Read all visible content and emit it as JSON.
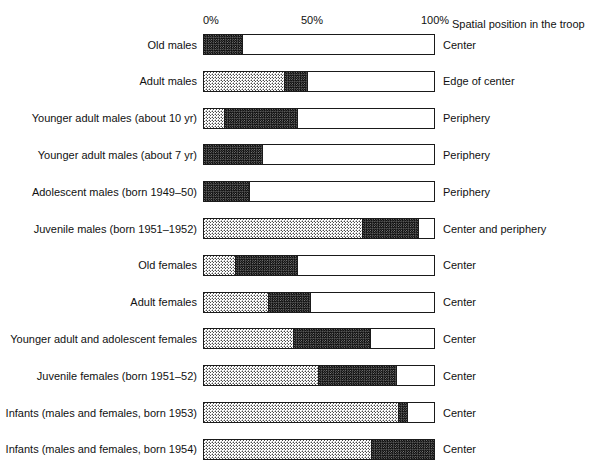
{
  "chart_data": {
    "type": "bar",
    "subtype": "stacked-horizontal-percentage",
    "title": "",
    "xlabel": "",
    "ylabel": "",
    "xlim": [
      0,
      100
    ],
    "grid": false,
    "legend_position": "none",
    "axis_caption": "Spatial position in the troop",
    "tick_labels": [
      "0%",
      "50%",
      "100%"
    ],
    "tick_values": [
      0,
      50,
      100
    ],
    "series": [
      {
        "name": "dark-stipple",
        "color": "#555555"
      },
      {
        "name": "light-stipple",
        "color": "#cccccc"
      },
      {
        "name": "white",
        "color": "#ffffff"
      }
    ],
    "categories": [
      "Old males",
      "Adult males",
      "Younger adult males (about 10 yr)",
      "Younger adult males (about 7 yr)",
      "Adolescent males (born 1949–50)",
      "Juvenile males (born 1951–1952)",
      "Old females",
      "Adult females",
      "Younger adult and adolescent females",
      "Juvenile females (born 1951–52)",
      "Infants (males and females, born 1953)",
      "Infants (males and females, born 1954)"
    ],
    "right_labels": [
      "Center",
      "Edge of center",
      "Periphery",
      "Periphery",
      "Periphery",
      "Center and periphery",
      "Center",
      "Center",
      "Center",
      "Center",
      "Center",
      "Center"
    ],
    "rows": [
      {
        "category": "Old males",
        "light_pct": 0,
        "dark_pct": 17,
        "white_pct": 83,
        "right_label": "Center"
      },
      {
        "category": "Adult males",
        "light_pct": 35,
        "dark_pct": 10,
        "white_pct": 55,
        "right_label": "Edge of center"
      },
      {
        "category": "Younger adult males (about 10 yr)",
        "light_pct": 9,
        "dark_pct": 31.5,
        "white_pct": 59.5,
        "right_label": "Periphery"
      },
      {
        "category": "Younger adult males (about 7 yr)",
        "light_pct": 0,
        "dark_pct": 25.5,
        "white_pct": 74.5,
        "right_label": "Periphery"
      },
      {
        "category": "Adolescent males (born 1949–50)",
        "light_pct": 0,
        "dark_pct": 20,
        "white_pct": 80,
        "right_label": "Periphery"
      },
      {
        "category": "Juvenile males (born 1951–1952)",
        "light_pct": 68.5,
        "dark_pct": 24,
        "white_pct": 7.5,
        "right_label": "Center and periphery"
      },
      {
        "category": "Old females",
        "light_pct": 14,
        "dark_pct": 26.5,
        "white_pct": 59.5,
        "right_label": "Center"
      },
      {
        "category": "Adult females",
        "light_pct": 28,
        "dark_pct": 18,
        "white_pct": 54,
        "right_label": "Center"
      },
      {
        "category": "Younger adult and adolescent females",
        "light_pct": 39,
        "dark_pct": 33,
        "white_pct": 28,
        "right_label": "Center"
      },
      {
        "category": "Juvenile females (born 1951–52)",
        "light_pct": 49.5,
        "dark_pct": 33.5,
        "white_pct": 17,
        "right_label": "Center"
      },
      {
        "category": "Infants (males and females, born 1953)",
        "light_pct": 84,
        "dark_pct": 4,
        "white_pct": 12,
        "right_label": "Center"
      },
      {
        "category": "Infants (males and females, born 1954)",
        "light_pct": 72.5,
        "dark_pct": 27.5,
        "white_pct": 0,
        "right_label": "Center"
      }
    ]
  }
}
